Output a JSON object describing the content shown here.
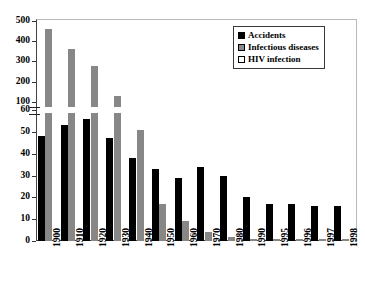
{
  "chart_data": {
    "type": "bar",
    "title": "",
    "subtitle": "",
    "xlabel": "",
    "ylabel": "",
    "grid": false,
    "legend_position": "top-right",
    "broken_axis": true,
    "axis_break_note": "y-axis compressed between 60 and 100",
    "categories": [
      "1900",
      "1910",
      "1920",
      "1930",
      "1940",
      "1950",
      "1960",
      "1970",
      "1980",
      "1990",
      "1995",
      "1996",
      "1997",
      "1998"
    ],
    "lower_ticks": [
      0,
      10,
      20,
      30,
      40,
      50
    ],
    "upper_ticks": [
      60,
      100,
      200,
      300,
      400,
      500
    ],
    "ylim_lower": [
      0,
      60
    ],
    "ylim_upper": [
      60,
      500
    ],
    "series": [
      {
        "name": "Accidents",
        "color": "#000000",
        "values": [
          48,
          53,
          56,
          47,
          38,
          33,
          29,
          34,
          30,
          20,
          17,
          17,
          16,
          16
        ]
      },
      {
        "name": "Infectious diseases",
        "color": "#878787",
        "values": [
          462,
          360,
          280,
          130,
          51,
          17,
          9,
          4,
          2,
          1,
          1,
          1,
          1,
          1
        ]
      },
      {
        "name": "HIV infection",
        "color": "#ffffff",
        "values": [
          0,
          0,
          0,
          0,
          0,
          0,
          0,
          0,
          0,
          0,
          0,
          0,
          0,
          0
        ]
      }
    ]
  },
  "legend": {
    "items": [
      {
        "label": "Accidents",
        "swatch": "accidents"
      },
      {
        "label": "Infectious diseases",
        "swatch": "infectious"
      },
      {
        "label": "HIV infection",
        "swatch": "hiv"
      }
    ]
  },
  "axis": {
    "y_labels": [
      "500",
      "400",
      "300",
      "200",
      "100",
      "60",
      "50",
      "40",
      "30",
      "20",
      "10",
      "0"
    ],
    "x_labels": [
      "1900",
      "1910",
      "1920",
      "1930",
      "1940",
      "1950",
      "1960",
      "1970",
      "1980",
      "1990",
      "1995",
      "1996",
      "1997",
      "1998"
    ]
  }
}
